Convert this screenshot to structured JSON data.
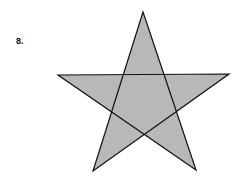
{
  "problem": {
    "number_label": "8."
  },
  "figure": {
    "shape": "five-pointed-star",
    "fill": "#b8b8b8",
    "stroke": "#111111",
    "vertices": {
      "top": [
        143,
        12
      ],
      "left": [
        58,
        75
      ],
      "right": [
        229,
        74
      ],
      "bottom_left": [
        93,
        171
      ],
      "bottom_right": [
        196,
        170
      ]
    }
  }
}
